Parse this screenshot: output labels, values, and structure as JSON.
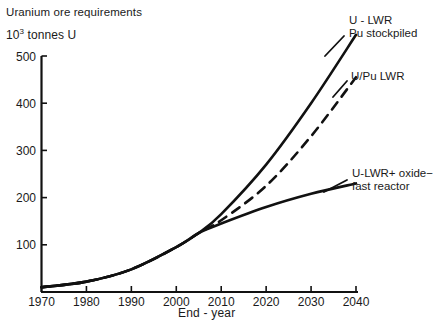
{
  "chart_data": {
    "type": "line",
    "title": "",
    "ylabel_line1": "Uranium ore",
    "ylabel_line2": "requirements",
    "ylabel_unit_mantissa": "10",
    "ylabel_unit_exponent": "3",
    "ylabel_unit_rest": " tonnes U",
    "xlabel": "End - year",
    "xlim": [
      1970,
      2040
    ],
    "ylim": [
      0,
      560
    ],
    "grid": false,
    "legend_position": "inline-right-of-curve-ends",
    "yticks": [
      100,
      200,
      300,
      400,
      500
    ],
    "ytick_labels": [
      "100",
      "200",
      "300",
      "400",
      "500"
    ],
    "xticks": [
      1970,
      1980,
      1990,
      2000,
      2010,
      2020,
      2030,
      2040
    ],
    "xtick_labels": [
      "1970",
      "1980",
      "1990",
      "2000",
      "2010",
      "2020",
      "2030",
      "2040"
    ],
    "x": [
      1970,
      1980,
      1990,
      2000,
      2005,
      2010,
      2020,
      2030,
      2040
    ],
    "series": [
      {
        "name": "U - LWR Pu stockpiled",
        "label_line1": "U - LWR",
        "label_line2": "Pu stockpiled",
        "style": "solid",
        "color": "#111111",
        "values": [
          10,
          22,
          48,
          95,
          125,
          165,
          270,
          400,
          545
        ],
        "label_x": 349,
        "label_y": 14
      },
      {
        "name": "U/Pu LWR",
        "label_line1": "U/Pu LWR",
        "label_line2": "",
        "style": "dashed",
        "color": "#111111",
        "values": [
          10,
          22,
          48,
          95,
          125,
          152,
          225,
          330,
          455
        ],
        "label_x": 351,
        "label_y": 70
      },
      {
        "name": "U-LWR+ oxide-fast reactor",
        "label_line1": "U-LWR+ oxide−",
        "label_line2": "fast  reactor",
        "style": "solid",
        "color": "#111111",
        "values": [
          10,
          22,
          48,
          95,
          125,
          145,
          180,
          208,
          230
        ],
        "label_x": 352,
        "label_y": 167
      }
    ]
  }
}
